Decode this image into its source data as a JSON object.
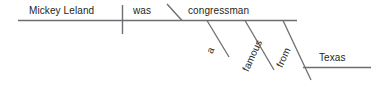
{
  "diagram": {
    "type": "reed-kellogg-sentence-diagram",
    "sentence": "Mickey Leland was a famous congressman from Texas.",
    "line_color": "#6d6e71",
    "text_color": "#231f20",
    "background_color": "#ffffff",
    "words": {
      "subject": "Mickey Leland",
      "verb": "was",
      "predicate_noun": "congressman",
      "article": "a",
      "adjective": "famous",
      "preposition": "from",
      "object_of_preposition": "Texas"
    }
  }
}
